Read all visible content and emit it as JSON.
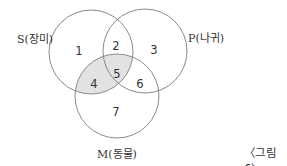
{
  "diagram": {
    "type": "venn",
    "sets": [
      {
        "id": "S",
        "label": "S(장미)"
      },
      {
        "id": "P",
        "label": "P(나귀)"
      },
      {
        "id": "M",
        "label": "M(동물)"
      }
    ],
    "regions": [
      {
        "number": "1",
        "membership": "S only"
      },
      {
        "number": "2",
        "membership": "S∩P only"
      },
      {
        "number": "3",
        "membership": "P only"
      },
      {
        "number": "4",
        "membership": "S∩M only",
        "shaded": true
      },
      {
        "number": "5",
        "membership": "S∩P∩M",
        "shaded": true
      },
      {
        "number": "6",
        "membership": "P∩M only"
      },
      {
        "number": "7",
        "membership": "M only"
      }
    ],
    "shade_color": "#e2e2e2",
    "stroke_color": "#8a8a8a",
    "caption": "〈그림 6〉"
  }
}
